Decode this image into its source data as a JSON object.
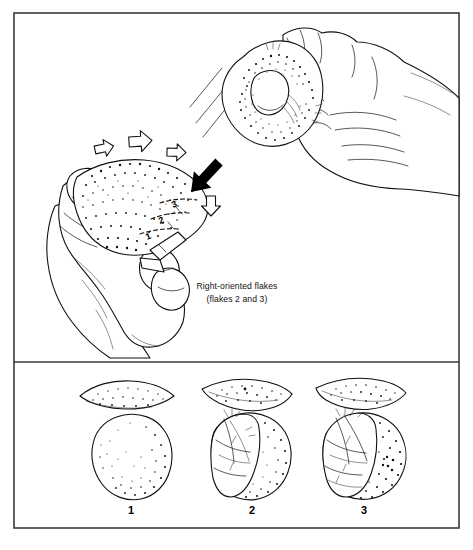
{
  "figure": {
    "type": "archaeological-line-illustration",
    "border_color": "#3a3a3a",
    "ink_color": "#111111",
    "background": "#ffffff"
  },
  "top_panel": {
    "name": "knapping-action-panel",
    "caption_line1": "Right-oriented flakes",
    "caption_line2": "(flakes 2 and 3)",
    "hammerstone": {
      "label": "hammerstone-in-right-hand",
      "texture": "stippled"
    },
    "core": {
      "label": "core-in-left-hand",
      "texture": "stippled",
      "flake_marks": [
        "1",
        "2",
        "3"
      ]
    },
    "arrows": {
      "hollow": [
        {
          "name": "hollow-arrow-1",
          "direction": "right"
        },
        {
          "name": "hollow-arrow-2",
          "direction": "right"
        },
        {
          "name": "hollow-arrow-3",
          "direction": "right"
        },
        {
          "name": "hollow-arrow-4",
          "direction": "down"
        }
      ],
      "solid": [
        {
          "name": "impact-arrow",
          "direction": "down-left",
          "color": "#000000"
        }
      ]
    },
    "motion_lines": 3
  },
  "bottom_panel": {
    "name": "artifact-sequence-panel",
    "artifacts": [
      {
        "number": "1",
        "profile": "lens-shaped unmodified cobble section",
        "plan": "round unflaked cobble",
        "texture": "stippled"
      },
      {
        "number": "2",
        "profile": "asymmetric section with one flake removal",
        "plan": "cobble with single flake scar on left",
        "texture": "stippled"
      },
      {
        "number": "3",
        "profile": "thin section with two flake removals",
        "plan": "cobble with larger compound flake scar on left",
        "texture": "stippled"
      }
    ]
  }
}
